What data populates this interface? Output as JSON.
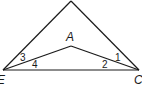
{
  "diagram": {
    "type": "geometry",
    "points": {
      "top": {
        "x": 71,
        "y": 1,
        "label": ""
      },
      "E": {
        "x": 3,
        "y": 70,
        "label": "E"
      },
      "C": {
        "x": 139,
        "y": 70,
        "label": "C"
      },
      "A": {
        "x": 71,
        "y": 46,
        "label": "A"
      }
    },
    "segments": [
      [
        "top",
        "E"
      ],
      [
        "top",
        "C"
      ],
      [
        "E",
        "C"
      ],
      [
        "E",
        "A"
      ],
      [
        "A",
        "C"
      ]
    ],
    "angle_labels": [
      {
        "id": "1",
        "text": "1",
        "x": 117,
        "y": 61
      },
      {
        "id": "2",
        "text": "2",
        "x": 104,
        "y": 68
      },
      {
        "id": "3",
        "text": "3",
        "x": 21,
        "y": 61
      },
      {
        "id": "4",
        "text": "4",
        "x": 33,
        "y": 68
      }
    ],
    "stroke_color": "#1a1a1a"
  }
}
